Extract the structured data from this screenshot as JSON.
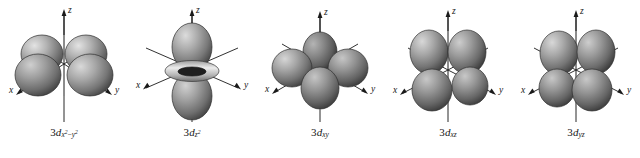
{
  "figure": {
    "name": "five-3d-orbital-shapes",
    "background_color": "#ffffff",
    "orbital_count": 5
  },
  "axes": {
    "z_label": "z",
    "x_label": "x",
    "y_label": "y"
  },
  "colors": {
    "lobe_light": "#d8d8d8",
    "lobe_mid": "#9a9a9a",
    "lobe_dark": "#4a4a4a",
    "lobe_edge": "#2e2e2e",
    "axis_line": "#1a1a1a",
    "label_text": "#161616",
    "torus_light": "#e2e2e2",
    "torus_dark": "#6d6d6d"
  },
  "orbitals": [
    {
      "id": "3d-x2-y2",
      "name": "3d x2-y2 orbital",
      "label_prefix": "3d",
      "label_sub_parts": [
        "x",
        "2",
        "−",
        "y",
        "2"
      ],
      "label_plain": "3dx²−y²",
      "lobe_count": 4,
      "has_torus": false,
      "description": "four lobes along x and y axes"
    },
    {
      "id": "3d-z2",
      "name": "3d z2 orbital",
      "label_prefix": "3d",
      "label_sub_parts": [
        "z",
        "2"
      ],
      "label_plain": "3dz²",
      "lobe_count": 2,
      "has_torus": true,
      "description": "two lobes along z axis with equatorial torus"
    },
    {
      "id": "3d-xy",
      "name": "3d xy orbital",
      "label_prefix": "3d",
      "label_sub_parts": [
        "x",
        "y"
      ],
      "label_plain": "3dxy",
      "lobe_count": 4,
      "has_torus": false,
      "description": "four lobes between x and y axes"
    },
    {
      "id": "3d-xz",
      "name": "3d xz orbital",
      "label_prefix": "3d",
      "label_sub_parts": [
        "x",
        "z"
      ],
      "label_plain": "3dxz",
      "lobe_count": 4,
      "has_torus": false,
      "description": "four lobes between x and z axes"
    },
    {
      "id": "3d-yz",
      "name": "3d yz orbital",
      "label_prefix": "3d",
      "label_sub_parts": [
        "y",
        "z"
      ],
      "label_plain": "3dyz",
      "lobe_count": 4,
      "has_torus": false,
      "description": "four lobes between y and z axes"
    }
  ]
}
